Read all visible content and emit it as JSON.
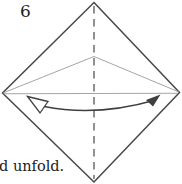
{
  "figure": {
    "step_label": "6",
    "caption": "d unfold."
  },
  "colors": {
    "background": "#ffffff",
    "paper_outline": "#474747",
    "dashed_center_line": "#565656",
    "crease_line": "#9b9b9b",
    "horizontal_crease": "#a6a6a6",
    "arrow": "#3f3f3f",
    "text": "#222222"
  }
}
